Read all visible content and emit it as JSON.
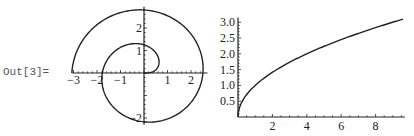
{
  "cell": {
    "out_label": "Out[3]="
  },
  "chart_data": [
    {
      "type": "line",
      "subtype": "parametric-polar",
      "title": "",
      "description": "Fermat spiral r = sqrt(theta), theta from 0 to 3*pi",
      "xlabel": "",
      "ylabel": "",
      "xlim": [
        -3.1,
        2.7
      ],
      "ylim": [
        -2.3,
        2.9
      ],
      "x_ticks": [
        -3,
        -2,
        -1,
        1,
        2
      ],
      "y_ticks": [
        -2,
        1,
        2
      ],
      "grid": false,
      "theta_range": [
        0,
        9.4248
      ],
      "color": "#222222"
    },
    {
      "type": "line",
      "title": "",
      "description": "y = sqrt(x)",
      "xlabel": "",
      "ylabel": "",
      "xlim": [
        0,
        9.6
      ],
      "ylim": [
        0,
        3.1
      ],
      "x_ticks": [
        2,
        4,
        6,
        8
      ],
      "y_ticks": [
        "0.5",
        "1.0",
        "1.5",
        "2.0",
        "2.5",
        "3.0"
      ],
      "grid": false,
      "x": [
        0,
        0.05,
        0.25,
        0.5,
        1,
        2,
        3,
        4,
        5,
        6,
        7,
        8,
        9,
        9.6
      ],
      "y": [
        0,
        0.224,
        0.5,
        0.707,
        1.0,
        1.414,
        1.732,
        2.0,
        2.236,
        2.449,
        2.646,
        2.828,
        3.0,
        3.098
      ],
      "color": "#222222"
    }
  ]
}
